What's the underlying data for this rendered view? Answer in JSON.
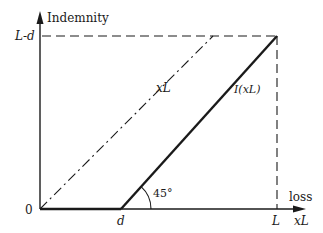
{
  "diagram": {
    "y_axis_label": "Indemnity",
    "x_axis_label": "loss",
    "x_axis_variable": "xL",
    "origin_label": "0",
    "y_tick_label": "L-d",
    "x_tick_d_label": "d",
    "x_tick_L_label": "L",
    "line_xL_label": "xL",
    "line_indemnity_label": "I(xL)",
    "angle_label": "45°"
  }
}
